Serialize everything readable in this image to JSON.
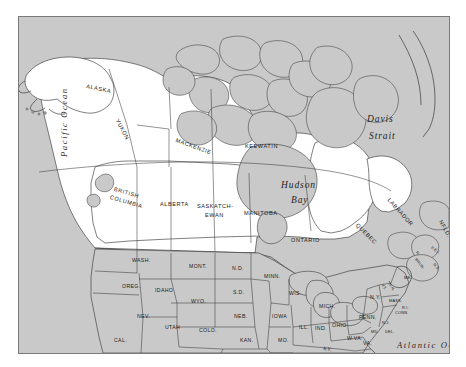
{
  "map": {
    "title": "North America - Canada and United States",
    "colors": {
      "background": "#ffffff",
      "ocean": "#c9c9c9",
      "land_gray": "#c9c9c9",
      "land_white": "#ffffff",
      "outline": "#3a3a3a",
      "frame": "#7a7a7a",
      "text": "#1a1a1a"
    },
    "water_labels": [
      {
        "name": "pacific-ocean",
        "text": "Pacific Ocean",
        "x": 40,
        "y": 140,
        "rotate": -90
      },
      {
        "name": "davis-strait-line1",
        "text": "Davis",
        "x": 348,
        "y": 97
      },
      {
        "name": "davis-strait-line2",
        "text": "Strait",
        "x": 350,
        "y": 114
      },
      {
        "name": "hudson-bay-line1",
        "text": "Hudson",
        "x": 262,
        "y": 163
      },
      {
        "name": "hudson-bay-line2",
        "text": "Bay",
        "x": 272,
        "y": 178
      },
      {
        "name": "atlantic-ocean",
        "text": "Atlantic Ocean",
        "x": 378,
        "y": 323
      }
    ],
    "canada_provinces": [
      {
        "name": "yukon",
        "text": "YUKON",
        "x": 101,
        "y": 101,
        "rotate": 62
      },
      {
        "name": "mackenzie",
        "text": "MACKENZIE",
        "x": 158,
        "y": 120,
        "rotate": 20
      },
      {
        "name": "keewatin",
        "text": "KEEWATIN",
        "x": 226,
        "y": 126,
        "rotate": 0
      },
      {
        "name": "british-columbia-line1",
        "text": "BRITISH",
        "x": 96,
        "y": 169,
        "rotate": 16
      },
      {
        "name": "british-columbia-line2",
        "text": "COLUMBIA",
        "x": 92,
        "y": 177,
        "rotate": 16
      },
      {
        "name": "alberta",
        "text": "ALBERTA",
        "x": 141,
        "y": 184,
        "rotate": 0
      },
      {
        "name": "saskatchewan-line1",
        "text": "SASKATCH-",
        "x": 178,
        "y": 186,
        "rotate": 0
      },
      {
        "name": "saskatchewan-line2",
        "text": "EWAN",
        "x": 186,
        "y": 195,
        "rotate": 0
      },
      {
        "name": "manitoba",
        "text": "MANITOBA",
        "x": 225,
        "y": 193,
        "rotate": 0
      },
      {
        "name": "ontario",
        "text": "ONTARIO",
        "x": 272,
        "y": 220,
        "rotate": 0
      },
      {
        "name": "quebec",
        "text": "QUEBEC",
        "x": 340,
        "y": 205,
        "rotate": 45
      },
      {
        "name": "labrador",
        "text": "LABRADOR",
        "x": 372,
        "y": 180,
        "rotate": 48
      },
      {
        "name": "newfoundland",
        "text": "NFLD.",
        "x": 424,
        "y": 202,
        "rotate": 60
      }
    ],
    "canada_maritimes": [
      {
        "name": "new-brunswick-line1",
        "text": "N.",
        "x": 400,
        "y": 233,
        "rotate": 52
      },
      {
        "name": "new-brunswick-line2",
        "text": "BRUN.",
        "x": 399,
        "y": 240,
        "rotate": 52
      },
      {
        "name": "prince-edward-island",
        "text": "P.E.I.",
        "x": 414,
        "y": 228,
        "rotate": 35
      },
      {
        "name": "nova-scotia",
        "text": "N.S.",
        "x": 417,
        "y": 245,
        "rotate": 50
      }
    ],
    "alaska": [
      {
        "name": "alaska",
        "text": "ALASKA",
        "x": 68,
        "y": 66,
        "rotate": 12
      }
    ],
    "us_states": [
      {
        "name": "washington",
        "text": "WASH.",
        "x": 113,
        "y": 240,
        "rotate": 0
      },
      {
        "name": "oregon",
        "text": "OREG.",
        "x": 103,
        "y": 266,
        "rotate": 0
      },
      {
        "name": "idaho",
        "text": "IDAHO",
        "x": 136,
        "y": 270,
        "rotate": 0
      },
      {
        "name": "montana",
        "text": "MONT.",
        "x": 170,
        "y": 246,
        "rotate": 0
      },
      {
        "name": "north-dakota",
        "text": "N.D.",
        "x": 213,
        "y": 248,
        "rotate": 0
      },
      {
        "name": "south-dakota",
        "text": "S.D.",
        "x": 214,
        "y": 272,
        "rotate": 0
      },
      {
        "name": "wyoming",
        "text": "WYO.",
        "x": 172,
        "y": 281,
        "rotate": 0
      },
      {
        "name": "nevada",
        "text": "NEV.",
        "x": 118,
        "y": 296,
        "rotate": 0
      },
      {
        "name": "utah",
        "text": "UTAH",
        "x": 146,
        "y": 307,
        "rotate": 0
      },
      {
        "name": "colorado",
        "text": "COLO.",
        "x": 180,
        "y": 310,
        "rotate": 0
      },
      {
        "name": "nebraska",
        "text": "NEB.",
        "x": 215,
        "y": 296,
        "rotate": 0
      },
      {
        "name": "kansas",
        "text": "KAN.",
        "x": 221,
        "y": 320,
        "rotate": 0
      },
      {
        "name": "california",
        "text": "CAL.",
        "x": 95,
        "y": 320,
        "rotate": 0
      },
      {
        "name": "arizona",
        "text": "ARIZ.",
        "x": 139,
        "y": 340,
        "rotate": 0
      },
      {
        "name": "new-mexico",
        "text": "N.M.",
        "x": 176,
        "y": 343,
        "rotate": 0
      },
      {
        "name": "oklahoma",
        "text": "OKLA.",
        "x": 222,
        "y": 345,
        "rotate": 0
      },
      {
        "name": "minnesota",
        "text": "MINN.",
        "x": 245,
        "y": 256,
        "rotate": 0
      },
      {
        "name": "iowa",
        "text": "IOWA",
        "x": 253,
        "y": 296,
        "rotate": 0
      },
      {
        "name": "wisconsin",
        "text": "WIS.",
        "x": 270,
        "y": 273,
        "rotate": 0
      },
      {
        "name": "missouri",
        "text": "MO.",
        "x": 259,
        "y": 320,
        "rotate": 0
      },
      {
        "name": "arkansas",
        "text": "ARK.",
        "x": 265,
        "y": 348,
        "rotate": 0
      },
      {
        "name": "illinois",
        "text": "ILL.",
        "x": 280,
        "y": 307,
        "rotate": 0
      },
      {
        "name": "michigan",
        "text": "MICH.",
        "x": 300,
        "y": 286,
        "rotate": 0
      },
      {
        "name": "indiana",
        "text": "IND.",
        "x": 296,
        "y": 308,
        "rotate": 0
      },
      {
        "name": "ohio",
        "text": "OHIO",
        "x": 313,
        "y": 305,
        "rotate": 0
      },
      {
        "name": "kentucky",
        "text": "KY.",
        "x": 305,
        "y": 328,
        "rotate": 10
      },
      {
        "name": "tennessee",
        "text": "TENN.",
        "x": 297,
        "y": 342,
        "rotate": 0
      },
      {
        "name": "pennsylvania",
        "text": "PENN.",
        "x": 340,
        "y": 297,
        "rotate": 0
      },
      {
        "name": "new-york",
        "text": "N.Y.",
        "x": 351,
        "y": 277,
        "rotate": 0
      },
      {
        "name": "west-virginia",
        "text": "W.VA.",
        "x": 328,
        "y": 318,
        "rotate": 0
      },
      {
        "name": "virginia",
        "text": "VA.",
        "x": 344,
        "y": 323,
        "rotate": 0
      },
      {
        "name": "north-carolina",
        "text": "N.C.",
        "x": 343,
        "y": 340,
        "rotate": 0
      }
    ],
    "us_small_states": [
      {
        "name": "maine",
        "text": "ME.",
        "x": 385,
        "y": 258,
        "rotate": 0
      },
      {
        "name": "vermont",
        "text": "VT.",
        "x": 366,
        "y": 266,
        "rotate": 60
      },
      {
        "name": "new-hampshire",
        "text": "N.H.",
        "x": 373,
        "y": 265,
        "rotate": 60
      },
      {
        "name": "massachusetts",
        "text": "MASS.",
        "x": 370,
        "y": 281,
        "rotate": 0
      },
      {
        "name": "rhode-island",
        "text": "R.I.",
        "x": 383,
        "y": 288,
        "rotate": 0
      },
      {
        "name": "connecticut",
        "text": "CONN.",
        "x": 376,
        "y": 293,
        "rotate": 0
      },
      {
        "name": "new-jersey",
        "text": "N.J.",
        "x": 363,
        "y": 303,
        "rotate": 0
      },
      {
        "name": "delaware",
        "text": "DEL.",
        "x": 366,
        "y": 312,
        "rotate": 0
      },
      {
        "name": "maryland",
        "text": "MD.",
        "x": 352,
        "y": 312,
        "rotate": 0
      }
    ]
  }
}
